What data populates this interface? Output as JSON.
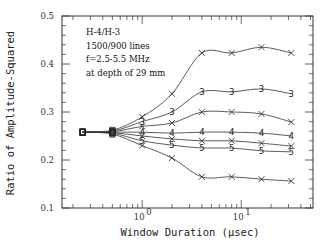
{
  "chart_data": {
    "type": "line",
    "title": "",
    "xlabel": "Window Duration (µsec)",
    "ylabel": "Ratio of Amplitude-Squared",
    "xscale": "log",
    "xlim": [
      0.155,
      53
    ],
    "ylim": [
      0.1,
      0.5
    ],
    "xticks": [
      {
        "value": 1,
        "label": "10",
        "exp": "0"
      },
      {
        "value": 10,
        "label": "10",
        "exp": "1"
      }
    ],
    "yticks": [
      0.1,
      0.2,
      0.3,
      0.4,
      0.5
    ],
    "ytick_labels": [
      "0.1",
      "0.2",
      "0.3",
      "0.4",
      "0.5"
    ],
    "grid": false,
    "legend": null,
    "annotation": [
      "H-4/H-3",
      "1500/900 lines",
      "f=2.5-5.5 MHz",
      "at depth of 29 mm"
    ],
    "x": [
      0.25,
      0.5,
      1,
      2,
      4,
      8,
      16,
      32
    ],
    "series": [
      {
        "name": "curve-1",
        "marker": "x",
        "values": [
          0.258,
          0.262,
          0.29,
          0.338,
          0.423,
          0.423,
          0.435,
          0.423
        ]
      },
      {
        "name": "curve-3",
        "marker": "3",
        "values": [
          0.258,
          0.26,
          0.28,
          0.3,
          0.342,
          0.342,
          0.348,
          0.338
        ]
      },
      {
        "name": "curve-2",
        "marker": "x",
        "values": [
          0.258,
          0.259,
          0.27,
          0.277,
          0.3,
          0.3,
          0.296,
          0.279
        ]
      },
      {
        "name": "curve-4",
        "marker": "4",
        "values": [
          0.258,
          0.258,
          0.258,
          0.256,
          0.258,
          0.258,
          0.256,
          0.25
        ]
      },
      {
        "name": "curve-6",
        "marker": "x",
        "values": [
          0.258,
          0.257,
          0.25,
          0.244,
          0.24,
          0.24,
          0.235,
          0.229
        ]
      },
      {
        "name": "curve-5",
        "marker": "5",
        "values": [
          0.258,
          0.256,
          0.24,
          0.231,
          0.225,
          0.225,
          0.219,
          0.217
        ]
      },
      {
        "name": "curve-7",
        "marker": "x",
        "values": [
          0.258,
          0.254,
          0.23,
          0.204,
          0.165,
          0.165,
          0.16,
          0.156
        ]
      }
    ]
  }
}
